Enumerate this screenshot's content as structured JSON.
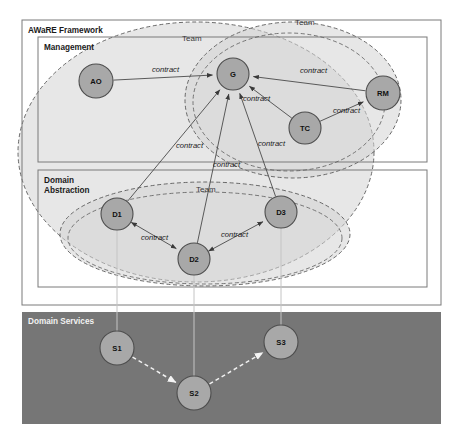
{
  "diagram": {
    "title": "AWaRE Framework",
    "panels": [
      {
        "id": "aware",
        "label": "AWaRE Framework",
        "x": 22,
        "y": 20,
        "w": 419,
        "h": 285
      },
      {
        "id": "management",
        "label": "Management",
        "x": 38,
        "y": 37,
        "w": 389,
        "h": 125
      },
      {
        "id": "domain-abstraction",
        "label": "Domain\nAbstraction",
        "label_line1": "Domain",
        "label_line2": "Abstraction",
        "x": 38,
        "y": 170,
        "w": 389,
        "h": 117
      },
      {
        "id": "domain-services",
        "label": "Domain Services",
        "x": 22,
        "y": 312,
        "w": 419,
        "h": 112
      }
    ],
    "nodes": [
      {
        "id": "AO",
        "label": "AO",
        "cx": 96,
        "cy": 81,
        "r": 17,
        "layer": "management"
      },
      {
        "id": "G",
        "label": "G",
        "cx": 233,
        "cy": 74,
        "r": 16,
        "layer": "management"
      },
      {
        "id": "RM",
        "label": "RM",
        "cx": 383,
        "cy": 93,
        "r": 17,
        "layer": "management"
      },
      {
        "id": "TC",
        "label": "TC",
        "cx": 305,
        "cy": 128,
        "r": 16,
        "layer": "management"
      },
      {
        "id": "D1",
        "label": "D1",
        "cx": 117,
        "cy": 214,
        "r": 16,
        "layer": "domain-abstraction"
      },
      {
        "id": "D2",
        "label": "D2",
        "cx": 194,
        "cy": 259,
        "r": 16,
        "layer": "domain-abstraction"
      },
      {
        "id": "D3",
        "label": "D3",
        "cx": 281,
        "cy": 212,
        "r": 16,
        "layer": "domain-abstraction"
      },
      {
        "id": "S1",
        "label": "S1",
        "cx": 117,
        "cy": 348,
        "r": 17,
        "layer": "domain-services"
      },
      {
        "id": "S2",
        "label": "S2",
        "cx": 194,
        "cy": 393,
        "r": 17,
        "layer": "domain-services"
      },
      {
        "id": "S3",
        "label": "S3",
        "cx": 281,
        "cy": 342,
        "r": 17,
        "layer": "domain-services"
      }
    ],
    "edges": [
      {
        "id": "ao-g",
        "from": "AO",
        "to": "G",
        "label": "contract",
        "label_x": 152,
        "label_y": 72,
        "arrow": "end"
      },
      {
        "id": "rm-g",
        "from": "RM",
        "to": "G",
        "label": "contract",
        "label_x": 300,
        "label_y": 73,
        "arrow": "end"
      },
      {
        "id": "tc-g",
        "from": "TC",
        "to": "G",
        "label": "contract",
        "label_x": 243,
        "label_y": 101,
        "arrow": "end"
      },
      {
        "id": "tc-rm",
        "from": "TC",
        "to": "RM",
        "label": "contract",
        "label_x": 333,
        "label_y": 113,
        "arrow": "end"
      },
      {
        "id": "d1-g",
        "from": "D1",
        "to": "G",
        "label": "contract",
        "label_x": 176,
        "label_y": 148,
        "arrow": "end"
      },
      {
        "id": "d2-g",
        "from": "D2",
        "to": "G",
        "label": "contract",
        "label_x": 213,
        "label_y": 167,
        "arrow": "end"
      },
      {
        "id": "d3-g",
        "from": "D3",
        "to": "G",
        "label": "contract",
        "label_x": 258,
        "label_y": 146,
        "arrow": "end"
      },
      {
        "id": "d1-d2",
        "from": "D1",
        "to": "D2",
        "label": "contract",
        "label_x": 141,
        "label_y": 240,
        "arrow": "both"
      },
      {
        "id": "d2-d3",
        "from": "D2",
        "to": "D3",
        "label": "contract",
        "label_x": 221,
        "label_y": 237,
        "arrow": "both"
      },
      {
        "id": "s1-s2",
        "from": "S1",
        "to": "S2",
        "label": "",
        "arrow": "end",
        "style": "dashed-white"
      },
      {
        "id": "s2-s3",
        "from": "S2",
        "to": "S3",
        "label": "",
        "arrow": "end",
        "style": "dashed-white"
      }
    ],
    "vertical_links": [
      {
        "id": "d1-s1",
        "from": "D1",
        "to": "S1"
      },
      {
        "id": "d2-s2",
        "from": "D2",
        "to": "S2"
      },
      {
        "id": "d3-s3",
        "from": "D3",
        "to": "S3"
      }
    ],
    "team_groups": [
      {
        "id": "team-outer-left",
        "label": "Team",
        "label_x": 182,
        "label_y": 41,
        "cx": 196,
        "cy": 152,
        "rx": 178,
        "ry": 130,
        "rot": 0
      },
      {
        "id": "team-upper-right",
        "label": "Team",
        "label_x": 295,
        "label_y": 25,
        "cx": 293,
        "cy": 100,
        "rx": 108,
        "ry": 78,
        "rot": 0
      },
      {
        "id": "team-lower",
        "label": "Team",
        "label_x": 196,
        "label_y": 192,
        "cx": 205,
        "cy": 234,
        "rx": 145,
        "ry": 52,
        "rot": 0
      }
    ],
    "colors": {
      "node_fill": "#a8a8a8",
      "node_stroke": "#4d4d4d",
      "frame_stroke": "#7a7a7a",
      "services_bg": "#767676",
      "services_title": "#f2f2f2",
      "team_stroke": "#5a5a5a",
      "group_fill": "#d4d4d4",
      "edge_stroke": "#4a4a4a",
      "service_edge": "#f0f0f0",
      "vertical_link": "#c4c4c4"
    }
  }
}
